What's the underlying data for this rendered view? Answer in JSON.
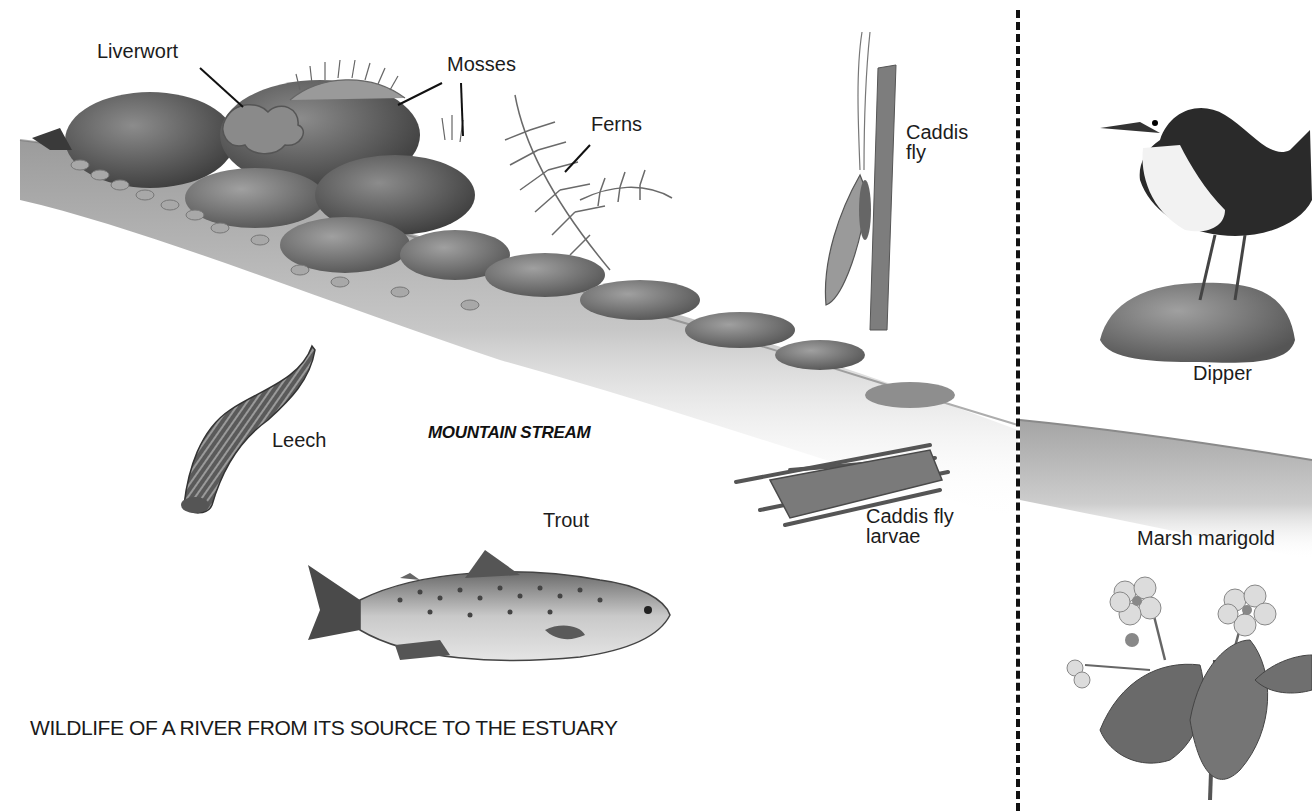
{
  "caption": "WILDLIFE OF A RIVER FROM ITS SOURCE TO THE ESTUARY",
  "section": {
    "title": "MOUNTAIN STREAM"
  },
  "labels": {
    "liverwort": "Liverwort",
    "mosses": "Mosses",
    "ferns": "Ferns",
    "caddis_fly": "Caddis\nfly",
    "leech": "Leech",
    "trout": "Trout",
    "caddis_fly_larvae": "Caddis fly\nlarvae",
    "dipper": "Dipper",
    "marsh_marigold": "Marsh marigold"
  },
  "colors": {
    "ink": "#1c1c1c",
    "rock_dark": "#4a4a4a",
    "rock_mid": "#7a7a7a",
    "bank_light": "#cfcfcf",
    "paper": "#ffffff"
  }
}
